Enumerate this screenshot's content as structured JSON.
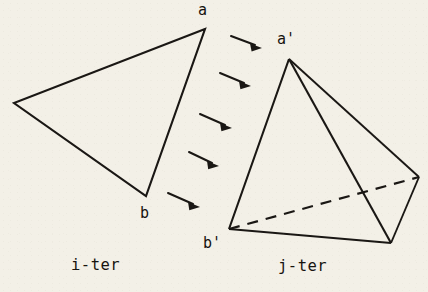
{
  "figure": {
    "background_color": "#f3f0e7",
    "ink_color": "#1a1714",
    "captions": {
      "left": "i-ter",
      "right": "j-ter"
    },
    "vertex_labels": {
      "a": "a",
      "b": "b",
      "a_prime": "a'",
      "b_prime": "b'"
    },
    "left_shape": {
      "name": "triangle",
      "points": "205,29 14,103 146,196",
      "closed": true,
      "vertices": [
        {
          "label": "a",
          "x": 205,
          "y": 29
        },
        {
          "label": "",
          "x": 14,
          "y": 103
        },
        {
          "label": "b",
          "x": 146,
          "y": 196
        }
      ]
    },
    "right_shape": {
      "name": "tetrahedron",
      "apex": {
        "label": "a'",
        "x": 289,
        "y": 59
      },
      "front_left": {
        "label": "b'",
        "x": 229,
        "y": 229
      },
      "front_right": {
        "label": "",
        "x": 391,
        "y": 243
      },
      "back_right": {
        "label": "",
        "x": 419,
        "y": 177
      },
      "solid_edges": [
        "289,59 229,229",
        "289,59 391,243",
        "229,229 391,243",
        "289,59 419,177",
        "419,177 391,243"
      ],
      "dashed_edges": [
        "229,229 419,177"
      ]
    },
    "arrows": [
      {
        "x1": 231,
        "y1": 36,
        "x2": 262,
        "y2": 48
      },
      {
        "x1": 220,
        "y1": 73,
        "x2": 251,
        "y2": 86
      },
      {
        "x1": 200,
        "y1": 114,
        "x2": 232,
        "y2": 128
      },
      {
        "x1": 189,
        "y1": 152,
        "x2": 219,
        "y2": 166
      },
      {
        "x1": 168,
        "y1": 193,
        "x2": 200,
        "y2": 207
      }
    ]
  }
}
